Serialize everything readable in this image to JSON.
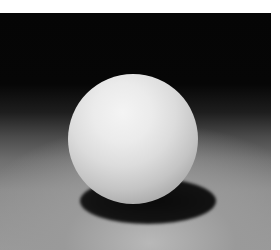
{
  "image": {
    "subject": "white sphere on a surface with cast shadow",
    "background": "dark backdrop fading to grey floor",
    "colors": {
      "backdrop": "#050505",
      "floor": "#999999",
      "ball_highlight": "#f4f4f4",
      "ball_shade": "#8a8a8a",
      "shadow": "#0a0a0a",
      "margin": "#ffffff"
    }
  }
}
